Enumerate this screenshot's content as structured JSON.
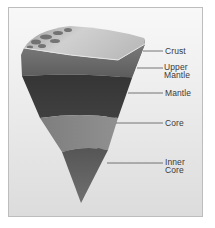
{
  "diagram": {
    "labels": [
      {
        "id": "crust",
        "text": "Crust"
      },
      {
        "id": "upper-mantle",
        "line1": "Upper",
        "line2": "Mantle"
      },
      {
        "id": "mantle",
        "text": "Mantle"
      },
      {
        "id": "core",
        "text": "Core"
      },
      {
        "id": "inner-core",
        "line1": "Inner",
        "line2": "Core"
      }
    ],
    "colors": {
      "frame_background": "#ececec",
      "crust_surface": "#c8c8c8",
      "upper_mantle": "#6a6a6a",
      "mantle": "#3a3a3a",
      "core": "#8a8a8a",
      "inner_core": "#4e4e4e",
      "leader_line": "#555555"
    }
  }
}
